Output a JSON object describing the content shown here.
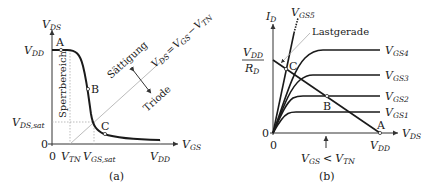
{
  "panel_a": {
    "caption": "(a)",
    "y_axis": {
      "symbol": "V",
      "sub": "DS"
    },
    "x_axis": {
      "symbol": "V",
      "sub": "GS"
    },
    "y_ticks": [
      {
        "symbol": "V",
        "sub": "DD"
      },
      {
        "symbol": "V",
        "sub": "DS,sat"
      },
      {
        "text": "0"
      }
    ],
    "x_ticks": [
      {
        "text": "0"
      },
      {
        "symbol": "V",
        "sub": "TN"
      },
      {
        "symbol": "V",
        "sub": "GS,sat"
      },
      {
        "symbol": "V",
        "sub": "DD"
      }
    ],
    "points": [
      "A",
      "B",
      "C"
    ],
    "regions": {
      "cutoff": "Sperrbereich",
      "saturation": "Sättigung",
      "triode": "Triode"
    },
    "boundary_equation": "V_DS = V_GS − V_TN",
    "boundary": {
      "lhs": {
        "symbol": "V",
        "sub": "DS"
      },
      "eq": "=",
      "mid": {
        "symbol": "V",
        "sub": "GS"
      },
      "minus": "−",
      "rhs": {
        "symbol": "V",
        "sub": "TN"
      }
    }
  },
  "panel_b": {
    "caption": "(b)",
    "y_axis": {
      "symbol": "I",
      "sub": "D"
    },
    "x_axis": {
      "symbol": "V",
      "sub": "DS"
    },
    "y_ticks": [
      {
        "fraction_num": {
          "symbol": "V",
          "sub": "DD"
        },
        "fraction_den": {
          "symbol": "R",
          "sub": "D"
        }
      },
      {
        "text": "0"
      }
    ],
    "x_ticks": [
      {
        "text": "0"
      },
      {
        "symbol": "V",
        "sub": "DD"
      }
    ],
    "curves": [
      {
        "symbol": "V",
        "sub": "GS5"
      },
      {
        "symbol": "V",
        "sub": "GS4"
      },
      {
        "symbol": "V",
        "sub": "GS3"
      },
      {
        "symbol": "V",
        "sub": "GS2"
      },
      {
        "symbol": "V",
        "sub": "GS1"
      }
    ],
    "load_line_label": "Lastgerade",
    "points": [
      "A",
      "B",
      "C"
    ],
    "cutoff_note": {
      "lhs": {
        "symbol": "V",
        "sub": "GS"
      },
      "op": "<",
      "rhs": {
        "symbol": "V",
        "sub": "TN"
      }
    }
  }
}
